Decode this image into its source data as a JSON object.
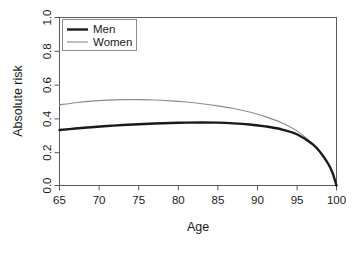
{
  "chart_data": {
    "type": "line",
    "title": "",
    "subtitle": "",
    "xlabel": "Age",
    "ylabel": "Absolute risk",
    "xlim": [
      65,
      100
    ],
    "ylim": [
      0.0,
      1.0
    ],
    "xticks": [
      65,
      70,
      75,
      80,
      85,
      90,
      95,
      100
    ],
    "xticklabels": [
      "65",
      "70",
      "75",
      "80",
      "85",
      "90",
      "95",
      "100"
    ],
    "yticks": [
      0.0,
      0.2,
      0.4,
      0.6,
      0.8,
      1.0
    ],
    "yticklabels": [
      "0.0",
      "0.2",
      "0.4",
      "0.6",
      "0.8",
      "1.0"
    ],
    "grid": false,
    "legend_position": "top-left-inside",
    "legend_boxed": true,
    "x": [
      65,
      67,
      69,
      71,
      73,
      75,
      77,
      79,
      81,
      83,
      85,
      87,
      89,
      91,
      93,
      95,
      97,
      98,
      99,
      99.5,
      100
    ],
    "series": [
      {
        "name": "Men",
        "color": "#1a1a1a",
        "linewidth": 2.4,
        "values": [
          0.33,
          0.339,
          0.347,
          0.354,
          0.36,
          0.365,
          0.369,
          0.372,
          0.374,
          0.375,
          0.374,
          0.37,
          0.363,
          0.352,
          0.335,
          0.305,
          0.245,
          0.195,
          0.125,
          0.075,
          0.0
        ]
      },
      {
        "name": "Women",
        "color": "#8c8c8c",
        "linewidth": 1.1,
        "values": [
          0.48,
          0.493,
          0.502,
          0.508,
          0.511,
          0.511,
          0.509,
          0.504,
          0.497,
          0.487,
          0.474,
          0.458,
          0.437,
          0.41,
          0.375,
          0.325,
          0.25,
          0.198,
          0.126,
          0.075,
          0.0
        ]
      }
    ]
  },
  "legend": {
    "entries": [
      {
        "label": "Men"
      },
      {
        "label": "Women"
      }
    ]
  },
  "axes": {
    "x_title": "Age",
    "y_title": "Absolute risk"
  }
}
